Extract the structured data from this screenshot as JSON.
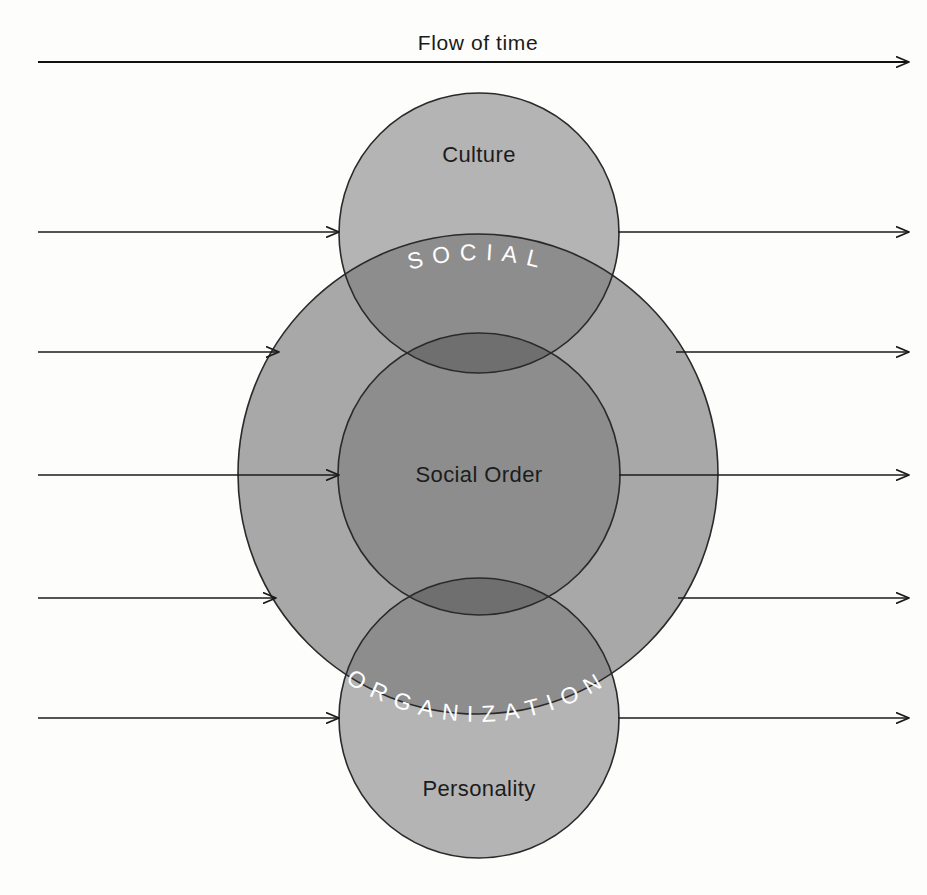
{
  "diagram": {
    "title": "Flow of time",
    "top_axis_label": "Flow of time",
    "circles": {
      "culture": {
        "label": "Culture",
        "cx": 479,
        "cy": 233,
        "r": 140,
        "fill": "#b4b4b4"
      },
      "social_order": {
        "label": "Social Order",
        "cx": 479,
        "cy": 474,
        "r": 141,
        "fill": "#8d8d8d"
      },
      "personality": {
        "label": "Personality",
        "cx": 479,
        "cy": 718,
        "r": 140,
        "fill": "#b4b4b4"
      },
      "large_social_organization": {
        "cx": 478,
        "cy": 474,
        "r": 240,
        "fill": "#a8a8a8"
      }
    },
    "arc_labels": {
      "upper": "S O C I A L",
      "lower": "O R G A N I Z A T I O N",
      "upper_plain": "SOCIAL",
      "lower_plain": "ORGANIZATION",
      "combined": "SOCIAL ORGANIZATION",
      "color": "#ffffff"
    },
    "colors": {
      "background": "#fdfdfc",
      "light_gray": "#b8b8b8",
      "mid_gray": "#a8a8a8",
      "dark_gray": "#8d8d8d",
      "darkest_gray": "#6f6f6f",
      "outline": "#2a2a2a",
      "arrow": "#1b1b1b",
      "text_dark": "#1c1c1c",
      "text_light": "#ffffff"
    },
    "flow_arrows": {
      "count": 6,
      "description": "Horizontal left-to-right arrows indicating passage of time",
      "top_axis": {
        "x1": 38,
        "x2": 915,
        "y": 60
      },
      "rows": [
        {
          "y": 232,
          "left_x1": 38,
          "left_x2": 342,
          "right_x1": 618,
          "right_x2": 915
        },
        {
          "y": 352,
          "left_x1": 38,
          "left_x2": 281,
          "right_x1": 676,
          "right_x2": 915
        },
        {
          "y": 475,
          "left_x1": 38,
          "left_x2": 341,
          "right_x1": 619,
          "right_x2": 915
        },
        {
          "y": 598,
          "left_x1": 38,
          "left_x2": 278,
          "right_x1": 678,
          "right_x2": 915
        },
        {
          "y": 718,
          "left_x1": 38,
          "left_x2": 342,
          "right_x1": 618,
          "right_x2": 915
        }
      ]
    }
  }
}
